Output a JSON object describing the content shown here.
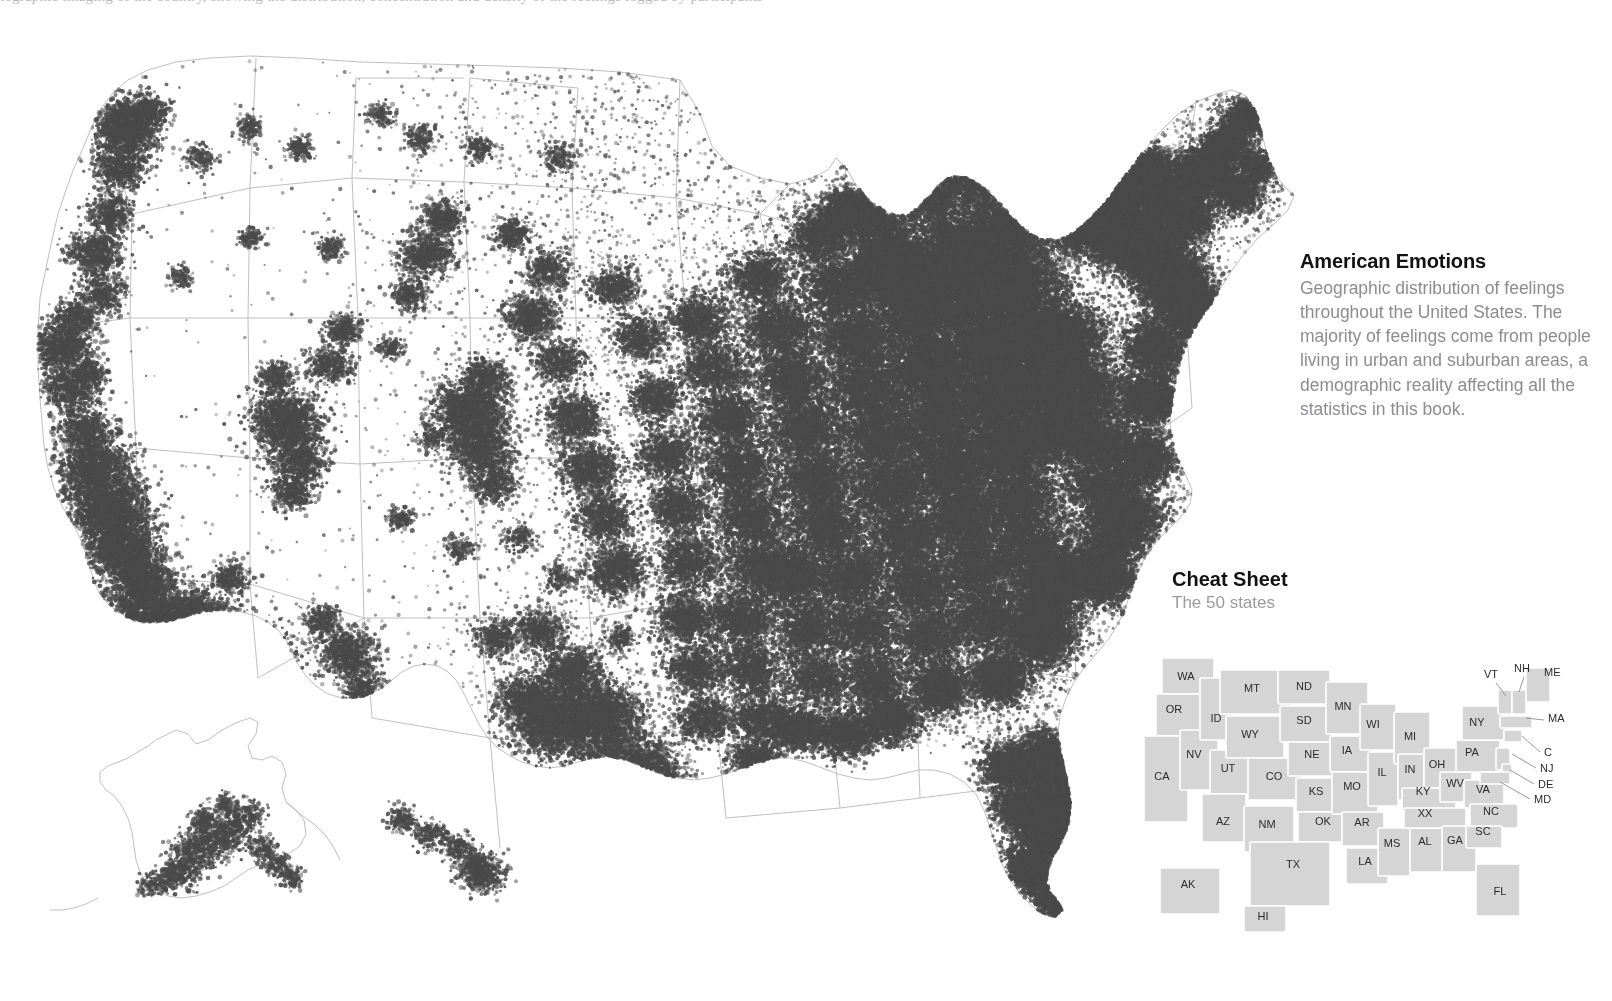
{
  "top_caption": "tographic imaging of the country, showing the distribution, concentration and density of the feelings logged by participants",
  "side": {
    "title": "American Emotions",
    "body": "Geographic distribution of feelings throughout the United States. The majority of feelings come from people living in urban and suburban areas, a demographic reality affecting all the statistics in this book."
  },
  "cheat": {
    "title": "Cheat Sheet",
    "subtitle": "The 50 states"
  },
  "colors": {
    "dot": "#4a4a4a",
    "background": "#ffffff",
    "state_fill": "#d5d5d5",
    "state_border": "#ffffff",
    "outline": "#b4b4b4",
    "title_text": "#121212",
    "body_text": "#8c8c92"
  },
  "chart_data": {
    "type": "scatter",
    "title": "American Emotions",
    "xlabel": "",
    "ylabel": "",
    "inset_regions": [
      "Alaska",
      "Hawaii"
    ],
    "density_note": "Dense in eastern US, coastal California, Pacific Northwest; sparse in Mountain West and Great Plains"
  },
  "cheat_states": [
    {
      "abbr": "WA",
      "x": 46,
      "y": 50
    },
    {
      "abbr": "OR",
      "x": 34,
      "y": 83
    },
    {
      "abbr": "ID",
      "x": 76,
      "y": 92
    },
    {
      "abbr": "MT",
      "x": 112,
      "y": 62
    },
    {
      "abbr": "ND",
      "x": 164,
      "y": 60
    },
    {
      "abbr": "SD",
      "x": 164,
      "y": 94
    },
    {
      "abbr": "MN",
      "x": 203,
      "y": 80
    },
    {
      "abbr": "WI",
      "x": 233,
      "y": 98
    },
    {
      "abbr": "MI",
      "x": 270,
      "y": 110
    },
    {
      "abbr": "WY",
      "x": 110,
      "y": 108
    },
    {
      "abbr": "NV",
      "x": 54,
      "y": 128
    },
    {
      "abbr": "CA",
      "x": 22,
      "y": 150
    },
    {
      "abbr": "UT",
      "x": 88,
      "y": 142
    },
    {
      "abbr": "CO",
      "x": 134,
      "y": 150
    },
    {
      "abbr": "NE",
      "x": 172,
      "y": 128
    },
    {
      "abbr": "IA",
      "x": 207,
      "y": 124
    },
    {
      "abbr": "IL",
      "x": 242,
      "y": 146
    },
    {
      "abbr": "IN",
      "x": 270,
      "y": 143
    },
    {
      "abbr": "OH",
      "x": 297,
      "y": 138
    },
    {
      "abbr": "PA",
      "x": 332,
      "y": 126
    },
    {
      "abbr": "NY",
      "x": 337,
      "y": 96
    },
    {
      "abbr": "KS",
      "x": 176,
      "y": 165
    },
    {
      "abbr": "MO",
      "x": 212,
      "y": 160
    },
    {
      "abbr": "KY",
      "x": 283,
      "y": 165
    },
    {
      "abbr": "WV",
      "x": 315,
      "y": 157
    },
    {
      "abbr": "VA",
      "x": 343,
      "y": 163
    },
    {
      "abbr": "NC",
      "x": 351,
      "y": 185
    },
    {
      "abbr": "XX",
      "x": 285,
      "y": 187
    },
    {
      "abbr": "AR",
      "x": 222,
      "y": 196
    },
    {
      "abbr": "OK",
      "x": 183,
      "y": 195
    },
    {
      "abbr": "SC",
      "x": 343,
      "y": 205
    },
    {
      "abbr": "GA",
      "x": 315,
      "y": 214
    },
    {
      "abbr": "AL",
      "x": 285,
      "y": 215
    },
    {
      "abbr": "MS",
      "x": 252,
      "y": 217
    },
    {
      "abbr": "LA",
      "x": 225,
      "y": 235
    },
    {
      "abbr": "TX",
      "x": 153,
      "y": 238
    },
    {
      "abbr": "AZ",
      "x": 83,
      "y": 195
    },
    {
      "abbr": "NM",
      "x": 127,
      "y": 198
    },
    {
      "abbr": "FL",
      "x": 360,
      "y": 265
    },
    {
      "abbr": "AK",
      "x": 48,
      "y": 258
    },
    {
      "abbr": "HI",
      "x": 123,
      "y": 290
    }
  ],
  "cheat_leader_states": [
    {
      "abbr": "VT",
      "lx": 344,
      "ly": 48,
      "x1": 356,
      "y1": 53,
      "x2": 366,
      "y2": 66
    },
    {
      "abbr": "NH",
      "lx": 374,
      "ly": 42,
      "x1": 384,
      "y1": 47,
      "x2": 379,
      "y2": 62
    },
    {
      "abbr": "ME",
      "lx": 404,
      "ly": 46,
      "x1": 0,
      "y1": 0,
      "x2": 0,
      "y2": 0
    },
    {
      "abbr": "MA",
      "lx": 408,
      "ly": 92,
      "x1": 404,
      "y1": 90,
      "x2": 386,
      "y2": 88
    },
    {
      "abbr": "C",
      "lx": 404,
      "ly": 126,
      "x1": 400,
      "y1": 122,
      "x2": 382,
      "y2": 106
    },
    {
      "abbr": "NJ",
      "lx": 400,
      "ly": 142,
      "x1": 396,
      "y1": 138,
      "x2": 372,
      "y2": 124
    },
    {
      "abbr": "DE",
      "lx": 398,
      "ly": 158,
      "x1": 394,
      "y1": 154,
      "x2": 370,
      "y2": 140
    },
    {
      "abbr": "MD",
      "lx": 394,
      "ly": 173,
      "x1": 390,
      "y1": 169,
      "x2": 360,
      "y2": 152
    }
  ]
}
